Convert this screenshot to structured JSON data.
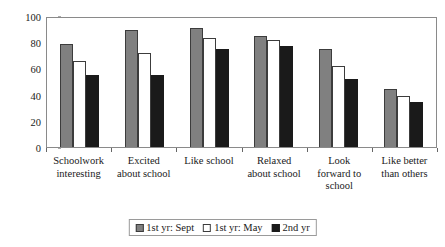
{
  "chart_data": {
    "type": "bar",
    "title": "",
    "xlabel": "",
    "ylabel": "% (Strongly) Agree",
    "ylim": [
      0,
      100
    ],
    "ytick_step": 20,
    "yticks": [
      0,
      20,
      40,
      60,
      80,
      100
    ],
    "grid": false,
    "legend_position": "bottom",
    "categories": [
      "Schoolwork interesting",
      "Excited about school",
      "Like school",
      "Relaxed about school",
      "Look forward to school",
      "Like better than others"
    ],
    "category_lines": [
      [
        "Schoolwork",
        "interesting"
      ],
      [
        "Excited",
        "about school"
      ],
      [
        "Like school"
      ],
      [
        "Relaxed",
        "about school"
      ],
      [
        "Look",
        "forward to",
        "school"
      ],
      [
        "Like better",
        "than others"
      ]
    ],
    "series": [
      {
        "name": "1st yr: Sept",
        "color": "#808080",
        "values": [
          79,
          89,
          91,
          85,
          75,
          44
        ]
      },
      {
        "name": "1st yr: May",
        "color": "#ffffff",
        "values": [
          66,
          72,
          83,
          82,
          62,
          39
        ]
      },
      {
        "name": "2nd yr",
        "color": "#1a1a1a",
        "values": [
          55,
          55,
          75,
          77,
          52,
          34
        ]
      }
    ]
  },
  "legend": {
    "items": [
      {
        "label": "1st yr: Sept"
      },
      {
        "label": "1st yr: May"
      },
      {
        "label": "2nd yr"
      }
    ]
  }
}
